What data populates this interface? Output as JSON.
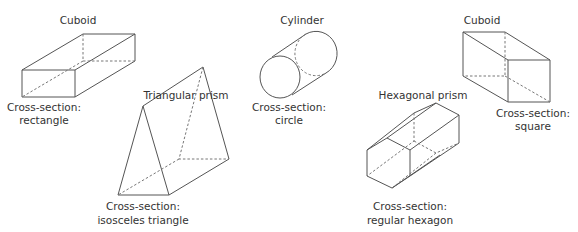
{
  "shapes": [
    {
      "name": "Cuboid",
      "cross_section_label": "Cross-section:",
      "cross_section": "rectangle"
    },
    {
      "name": "Triangular prism",
      "cross_section_label": "Cross-section:",
      "cross_section": "isosceles triangle"
    },
    {
      "name": "Cylinder",
      "cross_section_label": "Cross-section:",
      "cross_section": "circle"
    },
    {
      "name": "Hexagonal prism",
      "cross_section_label": "Cross-section:",
      "cross_section": "regular hexagon"
    },
    {
      "name": "Cuboid",
      "cross_section_label": "Cross-section:",
      "cross_section": "square"
    }
  ]
}
